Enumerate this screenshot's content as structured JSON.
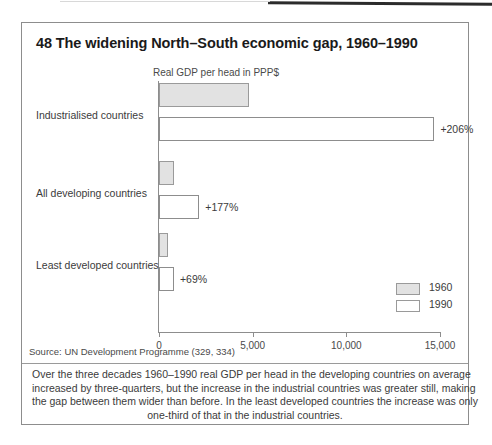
{
  "figure": {
    "title": "48 The widening North–South economic gap, 1960–1990",
    "source_note": "Source: UN Development Programme (329, 334)",
    "caption_lines": [
      "Over the three decades 1960–1990 real GDP per head in the developing countries on average",
      "increased by three-quarters, but the increase in the industrial countries was greater still, making",
      "the gap between them wider than before. In the least developed countries the increase was only",
      "one-third of that in the industrial countries."
    ]
  },
  "chart_data": {
    "type": "bar",
    "orientation": "horizontal",
    "title": "48 The widening North–South economic gap, 1960–1990",
    "xlabel": "Real GDP per head in PPP$",
    "ylabel": "",
    "xlim": [
      0,
      15000
    ],
    "xticks": [
      0,
      5000,
      10000,
      15000
    ],
    "xtick_labels": [
      "0",
      "5,000",
      "10,000",
      "15,000"
    ],
    "grid": false,
    "legend_position": "bottom-right",
    "categories": [
      "Industrialised countries",
      "All developing countries",
      "Least developed countries"
    ],
    "series": [
      {
        "name": "1960",
        "color": "#e2e2e2",
        "values": [
          4800,
          800,
          480
        ]
      },
      {
        "name": "1990",
        "color": "#ffffff",
        "values": [
          14700,
          2150,
          800
        ]
      }
    ],
    "growth_labels": [
      "+206%",
      "+177%",
      "+69%"
    ],
    "annotations": [
      {
        "category": "Industrialised countries",
        "text": "+206%"
      },
      {
        "category": "All developing countries",
        "text": "+177%"
      },
      {
        "category": "Least developed countries",
        "text": "+69%"
      }
    ]
  },
  "legend": {
    "items": [
      {
        "label": "1960",
        "swatch": "gray"
      },
      {
        "label": "1990",
        "swatch": "white"
      }
    ]
  },
  "scale": {
    "px_per_unit": 0.018733,
    "origin_px": 137
  }
}
